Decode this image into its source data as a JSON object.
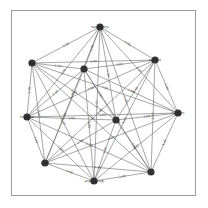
{
  "diagram": {
    "type": "complete-graph",
    "edge_weight_label": "1.00",
    "colors": {
      "node": "#333333",
      "edge": "#6a6a6a",
      "frame": "#9a9a9a",
      "background": "#ffffff"
    },
    "nodes": [
      {
        "id": "n0",
        "label": "respiratory",
        "x": 100,
        "y": 27
      },
      {
        "id": "n1",
        "label": "support",
        "x": 155,
        "y": 60
      },
      {
        "id": "n2",
        "label": "function",
        "x": 178,
        "y": 113
      },
      {
        "id": "n3",
        "label": "",
        "x": 151,
        "y": 172
      },
      {
        "id": "n4",
        "label": "engineering",
        "x": 94,
        "y": 181
      },
      {
        "id": "n5",
        "label": "gene",
        "x": 45,
        "y": 163
      },
      {
        "id": "n6",
        "label": "chemical",
        "x": 27,
        "y": 117
      },
      {
        "id": "n7",
        "label": "cell",
        "x": 32,
        "y": 63
      },
      {
        "id": "n8",
        "label": "",
        "x": 84,
        "y": 69
      },
      {
        "id": "n9",
        "label": "",
        "x": 116,
        "y": 120
      }
    ]
  }
}
